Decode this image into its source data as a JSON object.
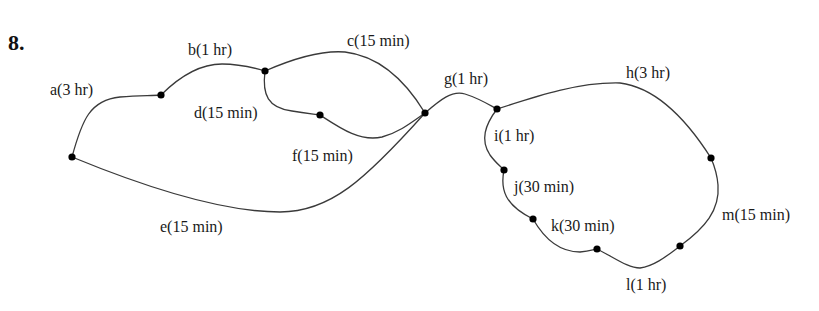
{
  "problem": {
    "number": "8."
  },
  "diagram": {
    "type": "activity-network",
    "nodes": [
      {
        "id": "n1",
        "x": 72,
        "y": 157
      },
      {
        "id": "n2",
        "x": 161,
        "y": 95
      },
      {
        "id": "n3",
        "x": 265,
        "y": 71
      },
      {
        "id": "n4",
        "x": 320,
        "y": 115
      },
      {
        "id": "n5",
        "x": 425,
        "y": 113
      },
      {
        "id": "n6",
        "x": 497,
        "y": 109
      },
      {
        "id": "n7",
        "x": 504,
        "y": 170
      },
      {
        "id": "n8",
        "x": 533,
        "y": 219
      },
      {
        "id": "n9",
        "x": 597,
        "y": 249
      },
      {
        "id": "n10",
        "x": 680,
        "y": 246
      },
      {
        "id": "n11",
        "x": 711,
        "y": 158
      }
    ],
    "edges": [
      {
        "name": "a",
        "duration": "3 hr",
        "label": "a(3 hr)",
        "from": "n1",
        "to": "n2"
      },
      {
        "name": "b",
        "duration": "1 hr",
        "label": "b(1 hr)",
        "from": "n2",
        "to": "n3"
      },
      {
        "name": "c",
        "duration": "15 min",
        "label": "c(15 min)",
        "from": "n3",
        "to": "n5"
      },
      {
        "name": "d",
        "duration": "15 min",
        "label": "d(15 min)",
        "from": "n3",
        "to": "n4"
      },
      {
        "name": "e",
        "duration": "15 min",
        "label": "e(15 min)",
        "from": "n1",
        "to": "n5"
      },
      {
        "name": "f",
        "duration": "15 min",
        "label": "f(15 min)",
        "from": "n4",
        "to": "n5"
      },
      {
        "name": "g",
        "duration": "1 hr",
        "label": "g(1 hr)",
        "from": "n5",
        "to": "n6"
      },
      {
        "name": "h",
        "duration": "3 hr",
        "label": "h(3 hr)",
        "from": "n6",
        "to": "n11"
      },
      {
        "name": "i",
        "duration": "1 hr",
        "label": "i(1 hr)",
        "from": "n6",
        "to": "n7"
      },
      {
        "name": "j",
        "duration": "30 min",
        "label": "j(30 min)",
        "from": "n7",
        "to": "n8"
      },
      {
        "name": "k",
        "duration": "30 min",
        "label": "k(30 min)",
        "from": "n8",
        "to": "n9"
      },
      {
        "name": "l",
        "duration": "1 hr",
        "label": "l(1 hr)",
        "from": "n9",
        "to": "n10"
      },
      {
        "name": "m",
        "duration": "15 min",
        "label": "m(15 min)",
        "from": "n10",
        "to": "n11"
      }
    ]
  }
}
